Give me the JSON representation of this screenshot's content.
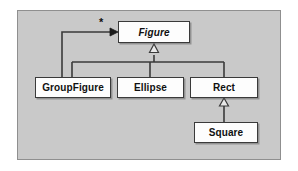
{
  "diagram": {
    "kind": "uml-class-diagram",
    "panel": {
      "background_color": "#c9c9c9",
      "border_color": "#8f8f8f"
    },
    "classes": [
      {
        "id": "figure",
        "name": "Figure",
        "abstract": true,
        "x": 118,
        "y": 21,
        "w": 72,
        "h": 22
      },
      {
        "id": "groupfigure",
        "name": "GroupFigure",
        "abstract": false,
        "x": 35,
        "y": 77,
        "w": 76,
        "h": 21
      },
      {
        "id": "ellipse",
        "name": "Ellipse",
        "abstract": false,
        "x": 117,
        "y": 77,
        "w": 67,
        "h": 21
      },
      {
        "id": "rect",
        "name": "Rect",
        "abstract": false,
        "x": 190,
        "y": 77,
        "w": 68,
        "h": 21
      },
      {
        "id": "square",
        "name": "Square",
        "abstract": false,
        "x": 194,
        "y": 122,
        "w": 64,
        "h": 21
      }
    ],
    "relations": [
      {
        "id": "rel-group-figure",
        "type": "aggregation-reference",
        "from": "groupfigure",
        "to": "figure",
        "label": "*",
        "arrow": "solid-filled"
      },
      {
        "id": "rel-group-inherit",
        "type": "generalization",
        "from": "groupfigure",
        "to": "figure",
        "label": "",
        "arrow": "hollow-triangle"
      },
      {
        "id": "rel-ellipse-inherit",
        "type": "generalization",
        "from": "ellipse",
        "to": "figure",
        "label": "",
        "arrow": "hollow-triangle"
      },
      {
        "id": "rel-rect-inherit",
        "type": "generalization",
        "from": "rect",
        "to": "figure",
        "label": "",
        "arrow": "hollow-triangle"
      },
      {
        "id": "rel-square-rect",
        "type": "generalization",
        "from": "square",
        "to": "rect",
        "label": "",
        "arrow": "hollow-triangle"
      }
    ],
    "multiplicity_label": "*",
    "colors": {
      "line": "#3a3a3a",
      "box_fill": "#fdfdfd",
      "box_border": "#3a3a3a",
      "text": "#101010"
    }
  }
}
